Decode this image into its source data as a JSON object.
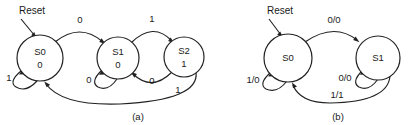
{
  "figure": {
    "kind": "finite-state-machine-diagrams",
    "background_color": "#ffffff",
    "line_color": "#222222",
    "text_color": "#1a1a1a"
  },
  "diagram_a": {
    "caption": "(a)",
    "reset_label": "Reset",
    "states": [
      {
        "id": "s0",
        "name": "S0",
        "output": "0",
        "cx": 40,
        "cy": 58,
        "r": 23
      },
      {
        "id": "s1",
        "name": "S1",
        "output": "0",
        "cx": 118,
        "cy": 58,
        "r": 21
      },
      {
        "id": "s2",
        "name": "S2",
        "output": "1",
        "cx": 184,
        "cy": 57,
        "r": 20
      }
    ],
    "transitions": [
      {
        "id": "s0-self",
        "from": "S0",
        "to": "S0",
        "label": "1",
        "label_x": 9,
        "label_y": 81
      },
      {
        "id": "s0-s1",
        "from": "S0",
        "to": "S1",
        "label": "0",
        "label_x": 80,
        "label_y": 23
      },
      {
        "id": "s1-self",
        "from": "S1",
        "to": "S1",
        "label": "0",
        "label_x": 89,
        "label_y": 83
      },
      {
        "id": "s1-s2",
        "from": "S1",
        "to": "S2",
        "label": "1",
        "label_x": 152,
        "label_y": 22
      },
      {
        "id": "s2-s1",
        "from": "S2",
        "to": "S1",
        "label": "0",
        "label_x": 152,
        "label_y": 84
      },
      {
        "id": "s2-s0",
        "from": "S2",
        "to": "S0",
        "label": "1",
        "label_x": 178,
        "label_y": 93
      }
    ]
  },
  "diagram_b": {
    "caption": "(b)",
    "reset_label": "Reset",
    "states": [
      {
        "id": "s0",
        "name": "S0",
        "output": "",
        "cx": 288,
        "cy": 58,
        "r": 24
      },
      {
        "id": "s1",
        "name": "S1",
        "output": "",
        "cx": 378,
        "cy": 58,
        "r": 22
      }
    ],
    "transitions": [
      {
        "id": "s0-self",
        "from": "S0",
        "to": "S0",
        "label": "1/0",
        "label_x": 253,
        "label_y": 83
      },
      {
        "id": "s0-s1",
        "from": "S0",
        "to": "S1",
        "label": "0/0",
        "label_x": 334,
        "label_y": 23
      },
      {
        "id": "s1-self",
        "from": "S1",
        "to": "S1",
        "label": "0/0",
        "label_x": 345,
        "label_y": 81
      },
      {
        "id": "s1-s0",
        "from": "S1",
        "to": "S0",
        "label": "1/1",
        "label_x": 337,
        "label_y": 98
      }
    ]
  }
}
